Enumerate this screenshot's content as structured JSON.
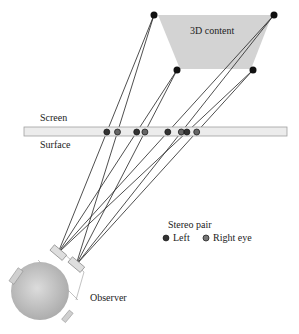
{
  "diagram": {
    "content_label": "3D content",
    "screen_label": "Screen",
    "surface_label": "Surface",
    "observer_label": "Observer",
    "legend": {
      "title": "Stereo pair",
      "left_label": "Left",
      "right_label": "Right eye"
    },
    "colors": {
      "content_fill": "#d3d3d3",
      "screen_fill": "#ececec",
      "screen_stroke": "#a0a0a0",
      "point": "#111111",
      "screen_point": "#555555",
      "head": "#bdbdbd",
      "line": "#222222"
    }
  }
}
